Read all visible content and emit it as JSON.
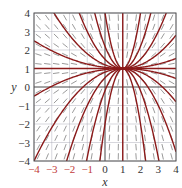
{
  "chart_data": {
    "type": "direction_field",
    "title": "",
    "xlabel": "x",
    "ylabel": "y",
    "xlim": [
      -4,
      4
    ],
    "ylim": [
      -4,
      4
    ],
    "x_ticks": [
      -4,
      -3,
      -2,
      -1,
      0,
      1,
      2,
      3,
      4
    ],
    "y_ticks": [
      -4,
      -3,
      -2,
      -1,
      0,
      1,
      2,
      3,
      4
    ],
    "grid": true,
    "legend": null,
    "equation_shown": false,
    "model": {
      "note": "No equation is printed in the figure. The slope field is rendered from an inferred model chosen to match the drawn behavior: all solution curves converge to a single node near (1, 1).",
      "inferred_equilibrium": [
        1,
        1
      ]
    },
    "observed_features": {
      "equilibrium_node_approx": [
        1.0,
        0.8
      ],
      "solution_curve_count_approx": 14,
      "slope_mark_grid": "approximately 0.5-unit spacing"
    }
  },
  "colors": {
    "curve": "#8b1a1a",
    "slope_mark": "#555555",
    "grid": "#9a9aa8",
    "frame": "#555555",
    "x_zero_line": "#333333",
    "negative_x_tick": "#c23b3b"
  },
  "layout": {
    "plot_left": 34,
    "plot_top": 13,
    "plot_right": 176,
    "plot_bottom": 161
  }
}
